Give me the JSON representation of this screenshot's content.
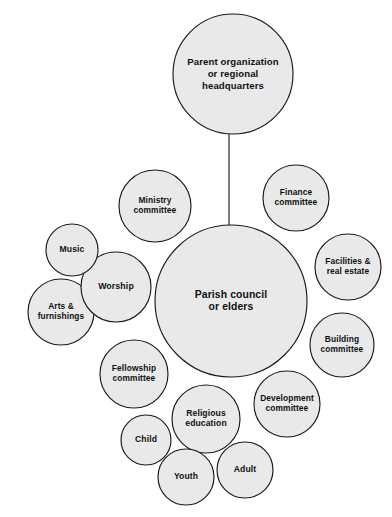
{
  "diagram": {
    "background_color": "#ffffff",
    "node_fill_color": "#e9e9e9",
    "node_stroke_color": "#1a1a1a",
    "label_color": "#111111",
    "nodes": [
      {
        "id": "parent-organization",
        "label_lines": [
          "Parent organization",
          "or regional",
          "headquarters"
        ],
        "cx": 233,
        "cy": 74,
        "r": 60,
        "font_size": 9.6,
        "line_height": 11.6
      },
      {
        "id": "parish-council",
        "label_lines": [
          "Parish council",
          "or elders"
        ],
        "cx": 231,
        "cy": 301,
        "r": 76,
        "font_size": 10.4,
        "line_height": 12.6
      },
      {
        "id": "ministry-committee",
        "label_lines": [
          "Ministry",
          "committee"
        ],
        "cx": 155,
        "cy": 206,
        "r": 36,
        "font_size": 8.4,
        "line_height": 10.2
      },
      {
        "id": "finance-committee",
        "label_lines": [
          "Finance",
          "committee"
        ],
        "cx": 296,
        "cy": 198,
        "r": 33,
        "font_size": 8.4,
        "line_height": 10.2
      },
      {
        "id": "facilities-real-estate",
        "label_lines": [
          "Facilities &",
          "real estate"
        ],
        "cx": 348,
        "cy": 267,
        "r": 33,
        "font_size": 8.4,
        "line_height": 10.2
      },
      {
        "id": "building-committee",
        "label_lines": [
          "Building",
          "committee"
        ],
        "cx": 342,
        "cy": 345,
        "r": 32,
        "font_size": 8.4,
        "line_height": 10.2
      },
      {
        "id": "development-committee",
        "label_lines": [
          "Development",
          "committee"
        ],
        "cx": 287,
        "cy": 404,
        "r": 33,
        "font_size": 8.4,
        "line_height": 10.2
      },
      {
        "id": "religious-education",
        "label_lines": [
          "Religious",
          "education"
        ],
        "cx": 206,
        "cy": 419,
        "r": 34,
        "font_size": 8.6,
        "line_height": 10.4
      },
      {
        "id": "adult",
        "label_lines": [
          "Adult"
        ],
        "cx": 245,
        "cy": 470,
        "r": 28,
        "font_size": 8.6,
        "line_height": 10.4
      },
      {
        "id": "youth",
        "label_lines": [
          "Youth"
        ],
        "cx": 186,
        "cy": 477,
        "r": 28,
        "font_size": 8.6,
        "line_height": 10.4
      },
      {
        "id": "child",
        "label_lines": [
          "Child"
        ],
        "cx": 146,
        "cy": 440,
        "r": 25,
        "font_size": 8.6,
        "line_height": 10.4
      },
      {
        "id": "fellowship-committee",
        "label_lines": [
          "Fellowship",
          "committee"
        ],
        "cx": 134,
        "cy": 374,
        "r": 34,
        "font_size": 8.4,
        "line_height": 10.2
      },
      {
        "id": "arts-furnishings",
        "label_lines": [
          "Arts &",
          "furnishings"
        ],
        "cx": 61,
        "cy": 312,
        "r": 33,
        "font_size": 8.4,
        "line_height": 10.2
      },
      {
        "id": "worship",
        "label_lines": [
          "Worship"
        ],
        "cx": 116,
        "cy": 287,
        "r": 35,
        "font_size": 8.8,
        "line_height": 10.6
      },
      {
        "id": "music",
        "label_lines": [
          "Music"
        ],
        "cx": 72,
        "cy": 250,
        "r": 26,
        "font_size": 8.6,
        "line_height": 10.4
      }
    ],
    "connectors": [
      {
        "id": "parent-to-parish",
        "from": "parent-organization",
        "to": "parish-council",
        "x1": 229,
        "y1": 134,
        "x2": 229,
        "y2": 226
      }
    ]
  }
}
